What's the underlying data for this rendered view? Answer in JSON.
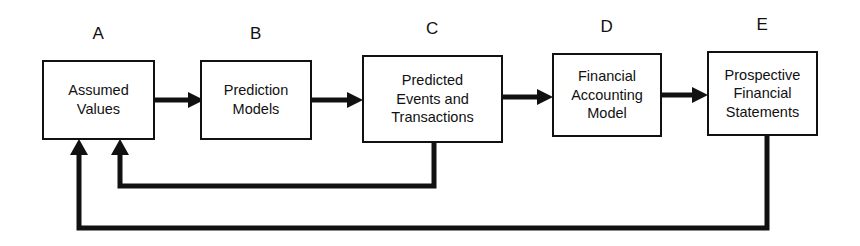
{
  "diagram": {
    "background_color": "#ffffff",
    "line_color": "#111111",
    "nodes": [
      {
        "id": "A",
        "label": "A",
        "text": "Assumed\nValues",
        "x": 42,
        "y": 60,
        "width": 113,
        "height": 80
      },
      {
        "id": "B",
        "label": "B",
        "text": "Prediction\nModels",
        "x": 200,
        "y": 60,
        "width": 112,
        "height": 80
      },
      {
        "id": "C",
        "label": "C",
        "text": "Predicted\nEvents and\nTransactions",
        "x": 362,
        "y": 55,
        "width": 141,
        "height": 88
      },
      {
        "id": "D",
        "label": "D",
        "text": "Financial\nAccounting\nModel",
        "x": 552,
        "y": 53,
        "width": 110,
        "height": 84
      },
      {
        "id": "E",
        "label": "E",
        "text": "Prospective\nFinancial\nStatements",
        "x": 707,
        "y": 51,
        "width": 111,
        "height": 85
      }
    ],
    "forward_arrows": [
      {
        "from": "A",
        "to": "B",
        "x1": 155,
        "x2": 200,
        "y": 100
      },
      {
        "from": "B",
        "to": "C",
        "x1": 312,
        "x2": 362,
        "y": 100
      },
      {
        "from": "C",
        "to": "D",
        "x1": 503,
        "x2": 552,
        "y": 97
      },
      {
        "from": "D",
        "to": "E",
        "x1": 662,
        "x2": 707,
        "y": 95
      }
    ],
    "feedback_loops": [
      {
        "name": "feedback-c-to-a",
        "from": "C",
        "to": "A",
        "drop_x": 434,
        "drop_y_start": 143,
        "rail_y": 186,
        "rise_x": 120,
        "arrow_tip_y": 141
      },
      {
        "name": "feedback-e-to-a",
        "from": "E",
        "to": "A",
        "drop_x": 767,
        "drop_y_start": 136,
        "rail_y": 228,
        "rise_x": 79,
        "arrow_tip_y": 141
      }
    ]
  }
}
